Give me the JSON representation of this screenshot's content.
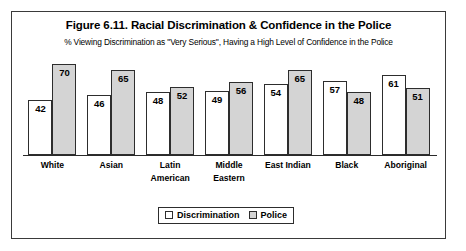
{
  "chart_data": {
    "type": "bar",
    "title": "Figure 6.11. Racial Discrimination & Confidence in the Police",
    "subtitle": "% Viewing Discrimination as \"Very Serious\", Having a High Level of Confidence in the Police",
    "xlabel": "",
    "ylabel": "",
    "ylim": [
      0,
      75
    ],
    "grid": false,
    "legend_position": "bottom-center",
    "categories": [
      "White",
      "Asian",
      "Latin American",
      "Middle Eastern",
      "East Indian",
      "Black",
      "Aboriginal"
    ],
    "category_lines": [
      [
        "White"
      ],
      [
        "Asian"
      ],
      [
        "Latin",
        "American"
      ],
      [
        "Middle",
        "Eastern"
      ],
      [
        "East Indian"
      ],
      [
        "Black"
      ],
      [
        "Aboriginal"
      ]
    ],
    "series": [
      {
        "name": "Discrimination",
        "color": "#ffffff",
        "values": [
          42,
          46,
          48,
          49,
          54,
          57,
          61
        ]
      },
      {
        "name": "Police",
        "color": "#d4d4d4",
        "values": [
          70,
          65,
          52,
          56,
          65,
          48,
          51
        ]
      }
    ]
  },
  "legend": {
    "items": [
      {
        "label": "Discrimination",
        "swatch": "#ffffff"
      },
      {
        "label": "Police",
        "swatch": "#d4d4d4"
      }
    ]
  }
}
